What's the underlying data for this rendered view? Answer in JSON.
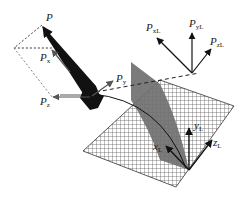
{
  "diagram": {
    "colors": {
      "vector": "#111111",
      "gray_vector": "#555555",
      "gray_plane": "#6e6e6e",
      "hatch": "#444444",
      "dashed": "#555555"
    },
    "labels": {
      "P": {
        "main": "P",
        "sub": ""
      },
      "Px": {
        "main": "P",
        "sub": "x"
      },
      "Py": {
        "main": "P",
        "sub": "y"
      },
      "Pz": {
        "main": "P",
        "sub": "z"
      },
      "PxL": {
        "main": "P",
        "sub": "xL"
      },
      "PyL": {
        "main": "P",
        "sub": "yL"
      },
      "PzL": {
        "main": "P",
        "sub": "zL"
      },
      "xL": {
        "main": "x",
        "sub": "L"
      },
      "yL": {
        "main": "y",
        "sub": "L"
      },
      "zL": {
        "main": "z",
        "sub": "L"
      }
    }
  }
}
